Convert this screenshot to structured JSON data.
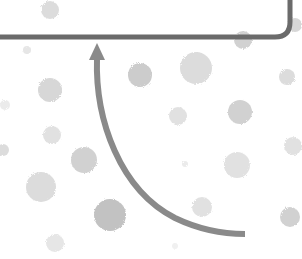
{
  "diagram": {
    "background": "#ffffff",
    "stroke_color": "#6b6b6b",
    "arrow_color": "#8a8a8a",
    "box": {
      "description": "bottom portion of rounded rectangle (cropped at top)",
      "right": 290,
      "bottom": 37,
      "radius": 15,
      "stroke_width": 5
    },
    "arrow": {
      "description": "curved arrow pointing up to box",
      "tip": [
        97,
        43
      ],
      "end": [
        245,
        234
      ],
      "stroke_width": 6
    },
    "dots": [
      {
        "x": 50,
        "y": 10,
        "r": 9,
        "o": 0.35
      },
      {
        "x": 243,
        "y": 40,
        "r": 9,
        "o": 0.45
      },
      {
        "x": 295,
        "y": 25,
        "r": 7,
        "o": 0.4
      },
      {
        "x": 27,
        "y": 50,
        "r": 4,
        "o": 0.25
      },
      {
        "x": 140,
        "y": 75,
        "r": 12,
        "o": 0.5
      },
      {
        "x": 196,
        "y": 68,
        "r": 16,
        "o": 0.35
      },
      {
        "x": 287,
        "y": 77,
        "r": 8,
        "o": 0.35
      },
      {
        "x": 50,
        "y": 90,
        "r": 12,
        "o": 0.4
      },
      {
        "x": 5,
        "y": 105,
        "r": 5,
        "o": 0.2
      },
      {
        "x": 178,
        "y": 116,
        "r": 9,
        "o": 0.3
      },
      {
        "x": 240,
        "y": 112,
        "r": 12,
        "o": 0.45
      },
      {
        "x": 52,
        "y": 135,
        "r": 9,
        "o": 0.3
      },
      {
        "x": 84,
        "y": 160,
        "r": 13,
        "o": 0.45
      },
      {
        "x": 3,
        "y": 150,
        "r": 6,
        "o": 0.35
      },
      {
        "x": 293,
        "y": 146,
        "r": 9,
        "o": 0.3
      },
      {
        "x": 237,
        "y": 165,
        "r": 13,
        "o": 0.3
      },
      {
        "x": 185,
        "y": 164,
        "r": 3,
        "o": 0.2
      },
      {
        "x": 41,
        "y": 187,
        "r": 15,
        "o": 0.35
      },
      {
        "x": 110,
        "y": 215,
        "r": 16,
        "o": 0.6
      },
      {
        "x": 202,
        "y": 207,
        "r": 10,
        "o": 0.3
      },
      {
        "x": 290,
        "y": 217,
        "r": 10,
        "o": 0.45
      },
      {
        "x": 55,
        "y": 243,
        "r": 9,
        "o": 0.25
      },
      {
        "x": 175,
        "y": 246,
        "r": 3,
        "o": 0.15
      }
    ]
  }
}
